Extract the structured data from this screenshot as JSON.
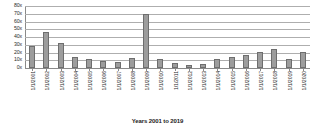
{
  "chart_data": {
    "type": "bar",
    "title": "",
    "xlabel": "Years 2001 to 2019",
    "ylabel": "",
    "grid": true,
    "legend": false,
    "ylim": [
      0,
      80
    ],
    "ytick_step": 10,
    "ytick_labels": [
      "80x",
      "70x",
      "60x",
      "50x",
      "40x",
      "30x",
      "20x",
      "10x",
      "0x"
    ],
    "ytick_values": [
      80,
      70,
      60,
      50,
      40,
      30,
      20,
      10,
      0
    ],
    "categories": [
      "1/1/2001",
      "1/1/2002",
      "1/1/2003",
      "1/1/2004",
      "1/1/2005",
      "1/1/2006",
      "1/1/2007",
      "1/1/2008",
      "1/1/2009",
      "1/1/2010",
      "1/1/2011",
      "1/1/2012",
      "1/1/2013",
      "1/1/2014",
      "1/1/2015",
      "1/1/2016",
      "1/1/2017",
      "1/1/2018",
      "1/1/2019",
      "1/1/2020"
    ],
    "values": [
      28,
      46,
      32,
      14,
      11,
      9,
      8,
      13,
      70,
      12,
      6,
      4,
      5,
      11,
      14,
      17,
      21,
      24,
      11,
      21
    ],
    "bar_color": "#9d9d9d",
    "bar_edge_color": "#6e6e6e",
    "grid_color": "#aeaeae",
    "axis_color": "#8a8a8a",
    "text_color": "#2b2b2b"
  }
}
